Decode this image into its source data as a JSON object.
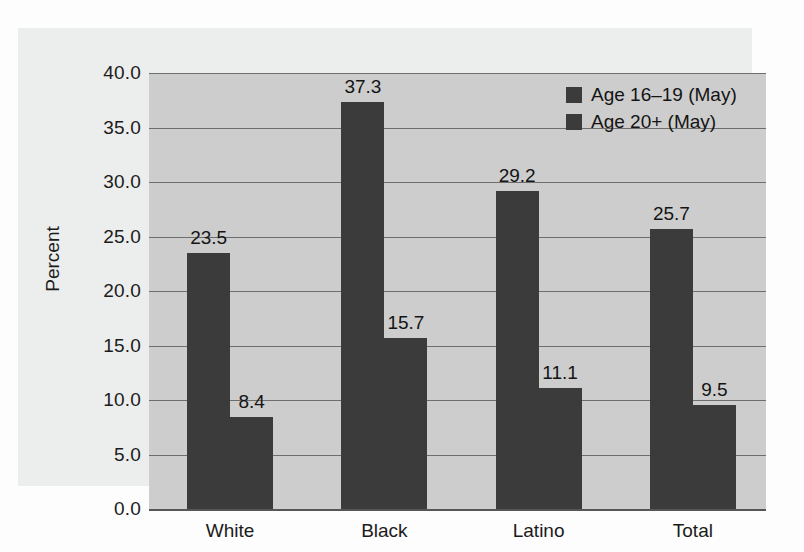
{
  "chart_data": {
    "type": "bar",
    "title": "",
    "xlabel": "",
    "ylabel": "Percent",
    "ylim": [
      0,
      40
    ],
    "ytick_step": 5,
    "grid": true,
    "legend_position": "top-right",
    "categories": [
      "White",
      "Black",
      "Latino",
      "Total"
    ],
    "ytick_labels": [
      "40.0",
      "35.0",
      "30.0",
      "25.0",
      "20.0",
      "15.0",
      "10.0",
      "5.0",
      "0.0"
    ],
    "ytick_values": [
      40,
      35,
      30,
      25,
      20,
      15,
      10,
      5,
      0
    ],
    "series": [
      {
        "name": "Age 16–19 (May)",
        "color": "#3b3b3b",
        "values": [
          23.5,
          37.3,
          29.2,
          25.7
        ],
        "labels": [
          "23.5",
          "37.3",
          "29.2",
          "25.7"
        ]
      },
      {
        "name": "Age 20+ (May)",
        "color": "#3b3b3b",
        "values": [
          8.4,
          15.7,
          11.1,
          9.5
        ],
        "labels": [
          "8.4",
          "15.7",
          "11.1",
          "9.5"
        ]
      }
    ]
  },
  "legend": {
    "items": [
      {
        "label": "Age 16–19 (May)",
        "swatch": "legend-swatch-series-1"
      },
      {
        "label": "Age 20+ (May)",
        "swatch": "legend-swatch-series-2"
      }
    ]
  },
  "colors": {
    "bar": "#3b3b3b",
    "plot_background": "#cdcdcd",
    "figure_background": "#eceded",
    "page_background": "#fdfdfd",
    "gridline": "#6e6e6e",
    "axis": "#565656",
    "text": "#141414"
  }
}
